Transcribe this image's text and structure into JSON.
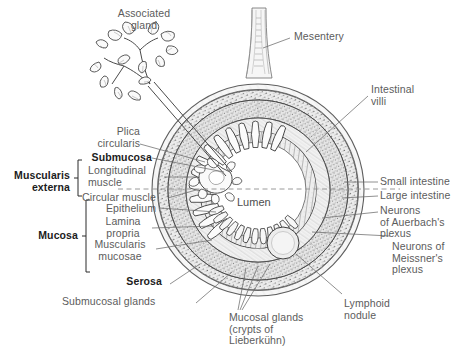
{
  "figure": {
    "kind": "anatomical-diagram",
    "lumen_label": "Lumen"
  },
  "labels": {
    "associated_gland": "Associated\ngland",
    "mesentery": "Mesentery",
    "intestinal_villi": "Intestinal\nvilli",
    "plica_circularis": "Plica\ncircularis",
    "submucosa": "Submucosa",
    "muscularis_externa": "Muscularis\nexterna",
    "longitudinal_muscle": "Longitudinal\nmuscle",
    "circular_muscle": "Circular muscle",
    "mucosa": "Mucosa",
    "epithelium": "Epithelium",
    "lamina_propria": "Lamina\npropria",
    "muscularis_mucosae": "Muscularis\nmucosae",
    "serosa": "Serosa",
    "submucosal_glands": "Submucosal glands",
    "mucosal_glands": "Mucosal glands\n(crypts of\nLieberkühn)",
    "small_intestine": "Small intestine",
    "large_intestine": "Large intestine",
    "auerbach": "Neurons\nof Auerbach's\nplexus",
    "meissner": "Neurons of\nMeissner's\nplexus",
    "lymphoid_nodule": "Lymphoid\nnodule"
  },
  "bold_labels": [
    "Submucosa",
    "Muscularis externa",
    "Mucosa",
    "Serosa"
  ],
  "colors": {
    "background": "#ffffff",
    "ink": "#4a4a4a",
    "ink_dark": "#1c1c1c",
    "label_gray": "#5c5c5c",
    "leader_line": "#6e6e6e",
    "dashed_divider": "#8a8a8a",
    "serosa_fill": "#f2f2f2",
    "muscle_fill": "#e4e4e4",
    "submucosa_fill": "#efefef",
    "mucosa_fill": "#e8e8e8",
    "lumen_fill": "#ffffff",
    "nodule_fill": "#ededed"
  },
  "geometry": {
    "center": [
      258,
      190
    ],
    "radii": {
      "serosa_outer": 106,
      "serosa_inner": 100,
      "longitudinal_outer": 100,
      "longitudinal_inner": 90,
      "circular_outer": 90,
      "circular_inner": 72,
      "submucosa_outer": 72,
      "submucosa_inner": 58,
      "mucosa_outer": 58,
      "lumen": 44
    },
    "divider_y": 189,
    "lymphoid_nodule": {
      "cx": 283,
      "cy": 243,
      "r": 16
    }
  }
}
